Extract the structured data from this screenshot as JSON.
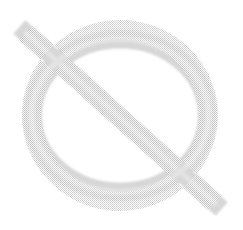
{
  "image": {
    "width": 243,
    "height": 230,
    "background_color": "#ffffff",
    "description": "empty-set symbol"
  },
  "glyph": {
    "name": "empty-set-symbol",
    "character": "∅",
    "stroke_color": "#c9c9c9",
    "stroke_color_light": "#e2e2e2",
    "average_color": "#d7d7d7",
    "texture": "halftone-dither",
    "parts": [
      {
        "name": "circle-outline",
        "shape": "ellipse",
        "center_x": 120,
        "center_y": 115,
        "radius_x": 97,
        "radius_y": 86,
        "stroke_width": 19
      },
      {
        "name": "diagonal-slash",
        "shape": "line",
        "x1": 26,
        "y1": 33,
        "x2": 215,
        "y2": 203,
        "stroke_width": 18
      }
    ]
  }
}
